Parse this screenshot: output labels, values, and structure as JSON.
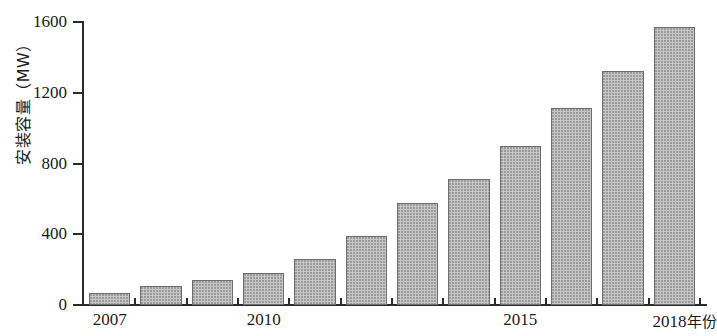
{
  "chart_data": {
    "type": "bar",
    "title": "",
    "subtitle": "",
    "xlabel": "年份",
    "ylabel": "安装容量（MW）",
    "categories": [
      "2007",
      "2008",
      "2009",
      "2010",
      "2011",
      "2012",
      "2013",
      "2014",
      "2015",
      "2016",
      "2017",
      "2018"
    ],
    "values": [
      70,
      110,
      140,
      180,
      260,
      390,
      575,
      715,
      900,
      1115,
      1325,
      1570
    ],
    "series": [
      {
        "name": "安装容量",
        "values": [
          70,
          110,
          140,
          180,
          260,
          390,
          575,
          715,
          900,
          1115,
          1325,
          1570
        ]
      }
    ],
    "ylim": [
      0,
      1600
    ],
    "y_ticks": [
      0,
      400,
      800,
      1200,
      1600
    ],
    "y_tick_labels": [
      "0",
      "400",
      "800",
      "1200",
      "1600"
    ],
    "x_tick_labels_shown": [
      "2007",
      "2010",
      "2015",
      "2018"
    ],
    "x_axis_unit_suffix": "年份",
    "grid": false,
    "legend": false,
    "legend_position": "none",
    "bar_color": "#c6c6c6",
    "bar_border_color": "#6e6e6e",
    "axis_color": "#2b2b2b",
    "background_color": "#ffffff"
  },
  "axes": {
    "y_title": "安装容量（MW）",
    "y_ticks": [
      {
        "value": 1600,
        "label": "1600"
      },
      {
        "value": 1200,
        "label": "1200"
      },
      {
        "value": 800,
        "label": "800"
      },
      {
        "value": 400,
        "label": "400"
      },
      {
        "value": 0,
        "label": "0"
      }
    ],
    "x_labels": [
      {
        "category": "2007",
        "label": "2007"
      },
      {
        "category": "2010",
        "label": "2010"
      },
      {
        "category": "2015",
        "label": "2015"
      },
      {
        "category": "2018",
        "label": "2018",
        "suffix": "年份"
      }
    ]
  }
}
